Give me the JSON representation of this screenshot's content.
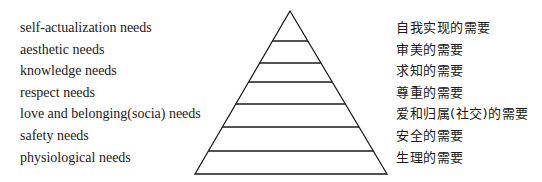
{
  "levels": [
    {
      "en": "self-actualization needs",
      "zh": "自我实现的需要"
    },
    {
      "en": "aesthetic needs",
      "zh": "审美的需要"
    },
    {
      "en": "knowledge needs",
      "zh": "求知的需要"
    },
    {
      "en": "respect needs",
      "zh": "尊重的需要"
    },
    {
      "en": "love and belonging(socia) needs",
      "zh": "爱和归属(社交)的需要"
    },
    {
      "en": "safety needs",
      "zh": "安全的需要"
    },
    {
      "en": "physiological needs",
      "zh": "生理的需要"
    }
  ],
  "colors": {
    "stroke": "#1a1a1a",
    "text": "#1a1a1a",
    "background": "#ffffff"
  }
}
